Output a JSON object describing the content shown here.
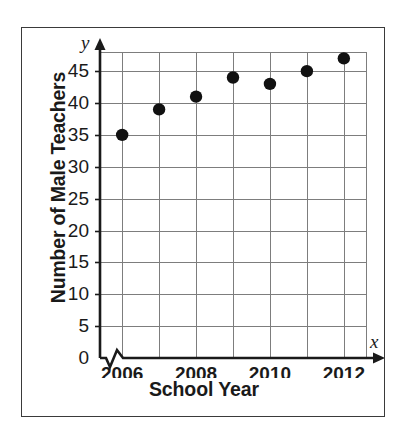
{
  "figure": {
    "border_color": "#3a3a3a",
    "background": "#ffffff"
  },
  "axis_labels": {
    "x_variable": "x",
    "y_variable": "y",
    "x_title": "School Year",
    "y_title": "Number of Male Teachers"
  },
  "chart_data": {
    "type": "scatter",
    "title": "",
    "xlabel": "School Year",
    "ylabel": "Number of Male Teachers",
    "x": [
      2006,
      2007,
      2008,
      2009,
      2010,
      2011,
      2012
    ],
    "values": [
      35,
      39,
      41,
      44,
      43,
      45,
      47
    ],
    "points": [
      {
        "x": 2006,
        "y": 35
      },
      {
        "x": 2007,
        "y": 39
      },
      {
        "x": 2008,
        "y": 41
      },
      {
        "x": 2009,
        "y": 44
      },
      {
        "x": 2010,
        "y": 43
      },
      {
        "x": 2011,
        "y": 45
      },
      {
        "x": 2012,
        "y": 47
      }
    ],
    "xlim": [
      2005.4,
      2012.6
    ],
    "ylim": [
      0,
      48
    ],
    "x_ticks": [
      2006,
      2007,
      2008,
      2009,
      2010,
      2011,
      2012
    ],
    "x_tick_labels": [
      "2006",
      "",
      "2008",
      "",
      "2010",
      "",
      "2012"
    ],
    "y_ticks": [
      0,
      5,
      10,
      15,
      20,
      25,
      30,
      35,
      40,
      45
    ],
    "y_tick_labels": [
      "0",
      "5",
      "10",
      "15",
      "20",
      "25",
      "30",
      "35",
      "40",
      "45"
    ],
    "grid": true,
    "grid_color": "#7d7d7d",
    "legend": null,
    "marker_color": "#111111",
    "x_axis_break": true,
    "annotations": []
  }
}
